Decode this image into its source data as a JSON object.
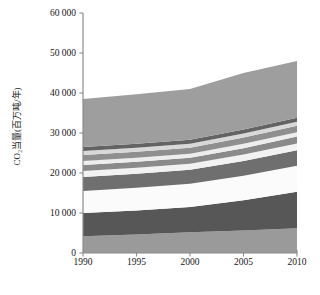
{
  "chart_data": {
    "type": "area",
    "stacked": true,
    "title": "",
    "xlabel": "",
    "ylabel": "CO₂当量(百万吨/年)",
    "x": [
      1990,
      1995,
      2000,
      2005,
      2010
    ],
    "xtick_labels": [
      "1990",
      "1995",
      "2000",
      "2005",
      "2010"
    ],
    "xlim": [
      1990,
      2010
    ],
    "ylim": [
      0,
      60000
    ],
    "ytick_values": [
      0,
      10000,
      20000,
      30000,
      40000,
      50000,
      60000
    ],
    "ytick_labels": [
      "0",
      "10 000",
      "20 000",
      "30 000",
      "40 000",
      "50 000",
      "60 000"
    ],
    "grid": false,
    "legend": "none",
    "series": [
      {
        "name": "series-1",
        "color": "#9a9a9a",
        "values": [
          4200,
          4600,
          5200,
          5600,
          6200
        ]
      },
      {
        "name": "series-2",
        "color": "#575757",
        "values": [
          5800,
          6000,
          6300,
          7600,
          9100
        ]
      },
      {
        "name": "series-3",
        "color": "#fbfbfb",
        "values": [
          5500,
          5700,
          5800,
          6100,
          6500
        ]
      },
      {
        "name": "series-4",
        "color": "#6f6f6f",
        "values": [
          3500,
          3500,
          3500,
          3700,
          3900
        ]
      },
      {
        "name": "series-5",
        "color": "#f2f2f2",
        "values": [
          1500,
          1500,
          1500,
          1600,
          1700
        ]
      },
      {
        "name": "series-6",
        "color": "#8a8a8a",
        "values": [
          1500,
          1500,
          1500,
          1600,
          1700
        ]
      },
      {
        "name": "series-7",
        "color": "#ededed",
        "values": [
          1000,
          1000,
          1000,
          1100,
          1100
        ]
      },
      {
        "name": "series-8",
        "color": "#8f8f8f",
        "values": [
          1500,
          1500,
          1500,
          1600,
          1600
        ]
      },
      {
        "name": "series-9",
        "color": "#d8d8d8",
        "values": [
          1000,
          1000,
          1000,
          1000,
          1000
        ]
      },
      {
        "name": "series-10",
        "color": "#636363",
        "values": [
          1000,
          1000,
          1000,
          1000,
          1000
        ]
      },
      {
        "name": "series-11",
        "color": "#9e9e9e",
        "values": [
          12000,
          12400,
          12700,
          14100,
          14200
        ]
      }
    ]
  },
  "axes": {
    "axis_color": "#8c8c8c",
    "tick_color": "#8c8c8c",
    "text_color": "#161616"
  }
}
